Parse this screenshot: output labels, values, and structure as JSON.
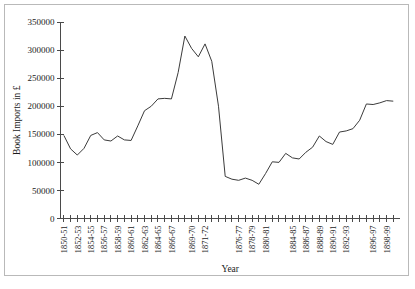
{
  "chart_data": {
    "type": "line",
    "title": "",
    "xlabel": "Year",
    "ylabel": "Book Imports in £",
    "ylim": [
      0,
      350000
    ],
    "ytick_values": [
      0,
      50000,
      100000,
      150000,
      200000,
      250000,
      300000,
      350000
    ],
    "ytick_labels": [
      "0",
      "50000",
      "100000",
      "150000",
      "200000",
      "250000",
      "300000",
      "350000"
    ],
    "grid": false,
    "legend": false,
    "legend_position": "none",
    "line_color": "#3b3b3b",
    "axis_color": "#4a4a4a",
    "categories": [
      "1850-51",
      "1851-52",
      "1852-53",
      "1853-54",
      "1854-55",
      "1855-56",
      "1856-57",
      "1857-58",
      "1858-59",
      "1859-60",
      "1860-61",
      "1861-62",
      "1862-63",
      "1863-64",
      "1864-65",
      "1865-66",
      "1866-67",
      "1867-68",
      "1868-69",
      "1869-70",
      "1870-71",
      "1871-72",
      "1872-73",
      "1873-74",
      "1874-75",
      "1875-76",
      "1876-77",
      "1877-78",
      "1878-79",
      "1879-80",
      "1880-81",
      "1881-82",
      "1882-83",
      "1883-84",
      "1884-85",
      "1885-86",
      "1886-87",
      "1887-88",
      "1888-89",
      "1889-90",
      "1890-91",
      "1891-92",
      "1892-93",
      "1893-94",
      "1894-95",
      "1895-96",
      "1896-97",
      "1897-98",
      "1898-99",
      "1899-00"
    ],
    "xtick_labels_shown": [
      "1850-51",
      "1852-53",
      "1854-55",
      "1856-57",
      "1858-59",
      "1860-61",
      "1862-63",
      "1864-65",
      "1866-67",
      "1869-70",
      "1871-72",
      "1876-77",
      "1878-79",
      "1880-81",
      "1884-85",
      "1886-87",
      "1888-89",
      "1890-91",
      "1892-93",
      "1896-97",
      "1898-99"
    ],
    "values": [
      148000,
      124000,
      113000,
      125000,
      148000,
      153000,
      140000,
      138000,
      147000,
      140000,
      139000,
      165000,
      192000,
      200000,
      213000,
      214000,
      213000,
      260000,
      325000,
      303000,
      288000,
      311000,
      280000,
      200000,
      75000,
      70000,
      68000,
      72000,
      68000,
      61000,
      80000,
      101000,
      100000,
      116000,
      108000,
      106000,
      118000,
      127000,
      147000,
      137000,
      132000,
      154000,
      156000,
      160000,
      175000,
      204000,
      203000,
      206000,
      210000,
      209000
    ],
    "series": [
      {
        "name": "Book Imports",
        "values": [
          148000,
          124000,
          113000,
          125000,
          148000,
          153000,
          140000,
          138000,
          147000,
          140000,
          139000,
          165000,
          192000,
          200000,
          213000,
          214000,
          213000,
          260000,
          325000,
          303000,
          288000,
          311000,
          280000,
          200000,
          75000,
          70000,
          68000,
          72000,
          68000,
          61000,
          80000,
          101000,
          100000,
          116000,
          108000,
          106000,
          118000,
          127000,
          147000,
          137000,
          132000,
          154000,
          156000,
          160000,
          175000,
          204000,
          203000,
          206000,
          210000,
          209000
        ]
      }
    ],
    "extra_points": {
      "note_tail_values": [
        211000,
        215000,
        213000,
        222000,
        187000,
        212000
      ]
    }
  }
}
